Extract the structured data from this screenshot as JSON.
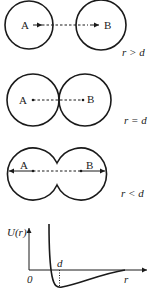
{
  "panels": [
    {
      "id": "separated",
      "atom_a_label": "A",
      "atom_b_label": "B",
      "condition_label": "r > d"
    },
    {
      "id": "touching",
      "atom_a_label": "A",
      "atom_b_label": "B",
      "condition_label": "r = d"
    },
    {
      "id": "overlapping",
      "atom_a_label": "A",
      "atom_b_label": "B",
      "condition_label": "r < d"
    }
  ],
  "potential_graph": {
    "y_axis_label": "U(r)",
    "x_axis_label": "r",
    "origin_label": "0",
    "marker_label": "d"
  },
  "colors": {
    "ink": "#1a1a1a",
    "background": "#ffffff"
  }
}
